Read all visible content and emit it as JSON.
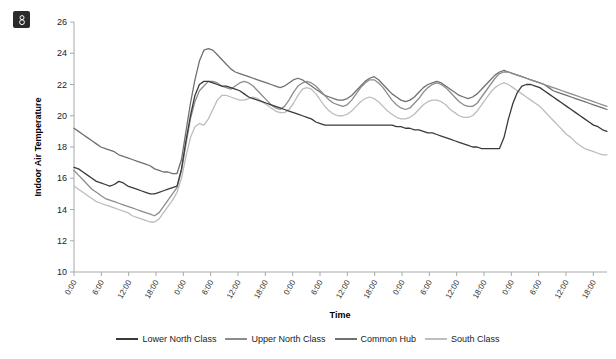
{
  "corner_icon": "image-placeholder-icon",
  "chart_data": {
    "type": "line",
    "title": "",
    "xlabel": "Time",
    "ylabel": "Indoor Air Temperature",
    "ylim": [
      10,
      26
    ],
    "ytick_labels": [
      "10",
      "12",
      "14",
      "16",
      "18",
      "20",
      "22",
      "24",
      "26"
    ],
    "ytick_values": [
      10,
      12,
      14,
      16,
      18,
      20,
      22,
      24,
      26
    ],
    "grid": false,
    "legend_position": "bottom",
    "xtick_labels": [
      "0:00",
      "6:00",
      "12:00",
      "18:00",
      "0:00",
      "6:00",
      "12:00",
      "18:00",
      "0:00",
      "6:00",
      "12:00",
      "18:00",
      "0:00",
      "6:00",
      "12:00",
      "18:00",
      "0:00",
      "6:00",
      "12:00",
      "18:00"
    ],
    "x_hours": [
      0,
      6,
      12,
      18,
      24,
      30,
      36,
      42,
      48,
      54,
      60,
      66,
      72,
      78,
      84,
      90,
      96,
      102,
      108,
      114
    ],
    "xlim_hours": [
      0,
      117
    ],
    "series": [
      {
        "name": "Lower North Class",
        "color": "#3a3a3a",
        "values": [
          16.7,
          16.6,
          16.4,
          16.2,
          16.0,
          15.8,
          15.7,
          15.6,
          15.5,
          15.6,
          15.8,
          15.7,
          15.5,
          15.4,
          15.3,
          15.2,
          15.1,
          15.0,
          15.0,
          15.1,
          15.2,
          15.3,
          15.4,
          15.5,
          16.6,
          18.4,
          20.0,
          21.3,
          22.0,
          22.2,
          22.2,
          22.1,
          22.0,
          21.9,
          21.9,
          21.8,
          21.7,
          21.6,
          21.4,
          21.2,
          21.1,
          21.0,
          20.9,
          20.8,
          20.7,
          20.6,
          20.5,
          20.4,
          20.3,
          20.2,
          20.1,
          20.0,
          19.9,
          19.8,
          19.6,
          19.5,
          19.4,
          19.4,
          19.4,
          19.4,
          19.4,
          19.4,
          19.4,
          19.4,
          19.4,
          19.4,
          19.4,
          19.4,
          19.4,
          19.4,
          19.4,
          19.4,
          19.3,
          19.3,
          19.2,
          19.2,
          19.1,
          19.1,
          19.0,
          18.9,
          18.9,
          18.8,
          18.7,
          18.6,
          18.5,
          18.4,
          18.3,
          18.2,
          18.1,
          18.0,
          18.0,
          17.9,
          17.9,
          17.9,
          17.9,
          17.9,
          18.6,
          19.8,
          20.8,
          21.5,
          21.9,
          22.0,
          22.0,
          21.9,
          21.8,
          21.6,
          21.4,
          21.2,
          21.0,
          20.8,
          20.6,
          20.4,
          20.2,
          20.0,
          19.8,
          19.6,
          19.4,
          19.3,
          19.1,
          19.0
        ]
      },
      {
        "name": "Upper North Class",
        "color": "#8c8c8c",
        "values": [
          16.5,
          16.2,
          15.9,
          15.6,
          15.3,
          15.1,
          14.9,
          14.7,
          14.6,
          14.5,
          14.4,
          14.3,
          14.2,
          14.1,
          14.0,
          13.9,
          13.8,
          13.7,
          13.6,
          13.8,
          14.2,
          14.6,
          15.0,
          15.4,
          16.5,
          18.2,
          19.8,
          20.9,
          21.6,
          21.9,
          22.2,
          22.2,
          22.1,
          21.9,
          21.8,
          21.7,
          21.9,
          22.1,
          22.2,
          22.1,
          21.9,
          21.6,
          21.3,
          21.0,
          20.7,
          20.5,
          20.4,
          20.6,
          21.0,
          21.5,
          21.9,
          22.1,
          22.2,
          22.1,
          21.9,
          21.6,
          21.3,
          21.0,
          20.8,
          20.7,
          20.6,
          20.7,
          21.0,
          21.4,
          21.8,
          22.1,
          22.3,
          22.3,
          22.1,
          21.8,
          21.4,
          21.0,
          20.7,
          20.5,
          20.4,
          20.5,
          20.8,
          21.1,
          21.5,
          21.8,
          22.0,
          22.1,
          22.0,
          21.8,
          21.5,
          21.2,
          20.9,
          20.7,
          20.6,
          20.6,
          20.8,
          21.2,
          21.6,
          22.0,
          22.4,
          22.7,
          22.8,
          22.8,
          22.7,
          22.6,
          22.5,
          22.4,
          22.3,
          22.2,
          22.1,
          22.0,
          21.9,
          21.8,
          21.7,
          21.6,
          21.5,
          21.4,
          21.3,
          21.2,
          21.1,
          21.0,
          20.9,
          20.8,
          20.7,
          20.6
        ]
      },
      {
        "name": "Common Hub",
        "color": "#707070",
        "values": [
          19.2,
          19.0,
          18.8,
          18.6,
          18.4,
          18.2,
          18.0,
          17.9,
          17.8,
          17.7,
          17.5,
          17.4,
          17.3,
          17.2,
          17.1,
          17.0,
          16.9,
          16.8,
          16.6,
          16.5,
          16.4,
          16.4,
          16.3,
          16.3,
          17.2,
          19.0,
          20.8,
          22.3,
          23.5,
          24.2,
          24.3,
          24.2,
          23.9,
          23.6,
          23.3,
          23.0,
          22.8,
          22.7,
          22.6,
          22.5,
          22.4,
          22.3,
          22.2,
          22.1,
          22.0,
          21.9,
          21.8,
          21.9,
          22.1,
          22.3,
          22.4,
          22.3,
          22.1,
          21.9,
          21.7,
          21.5,
          21.3,
          21.2,
          21.1,
          21.0,
          21.0,
          21.1,
          21.3,
          21.6,
          21.9,
          22.2,
          22.4,
          22.5,
          22.3,
          22.0,
          21.7,
          21.4,
          21.2,
          21.0,
          20.9,
          21.0,
          21.2,
          21.5,
          21.8,
          22.0,
          22.1,
          22.2,
          22.1,
          21.9,
          21.7,
          21.5,
          21.3,
          21.2,
          21.1,
          21.2,
          21.4,
          21.7,
          22.0,
          22.3,
          22.6,
          22.8,
          22.9,
          22.8,
          22.7,
          22.6,
          22.5,
          22.4,
          22.3,
          22.2,
          22.1,
          22.0,
          21.8,
          21.6,
          21.5,
          21.4,
          21.3,
          21.2,
          21.1,
          21.0,
          20.9,
          20.8,
          20.7,
          20.6,
          20.5,
          20.4
        ]
      },
      {
        "name": "South Class",
        "color": "#bdbdbd",
        "values": [
          15.5,
          15.3,
          15.1,
          14.9,
          14.7,
          14.5,
          14.4,
          14.3,
          14.2,
          14.1,
          14.0,
          13.9,
          13.8,
          13.6,
          13.5,
          13.4,
          13.3,
          13.2,
          13.2,
          13.4,
          13.8,
          14.2,
          14.6,
          15.1,
          16.0,
          17.4,
          18.6,
          19.3,
          19.5,
          19.4,
          19.8,
          20.4,
          21.0,
          21.3,
          21.3,
          21.2,
          21.1,
          21.0,
          21.0,
          21.1,
          21.2,
          21.1,
          20.9,
          20.7,
          20.5,
          20.3,
          20.2,
          20.2,
          20.4,
          20.8,
          21.3,
          21.7,
          21.8,
          21.7,
          21.4,
          21.0,
          20.6,
          20.3,
          20.1,
          20.0,
          20.0,
          20.1,
          20.3,
          20.6,
          20.9,
          21.1,
          21.2,
          21.1,
          20.9,
          20.6,
          20.3,
          20.1,
          19.9,
          19.8,
          19.8,
          19.9,
          20.1,
          20.4,
          20.7,
          20.9,
          21.0,
          21.0,
          20.9,
          20.7,
          20.4,
          20.2,
          20.0,
          19.9,
          19.9,
          20.0,
          20.3,
          20.7,
          21.1,
          21.5,
          21.8,
          22.0,
          22.1,
          22.0,
          21.8,
          21.6,
          21.4,
          21.2,
          21.0,
          20.8,
          20.6,
          20.3,
          20.0,
          19.7,
          19.4,
          19.1,
          18.8,
          18.6,
          18.3,
          18.1,
          17.9,
          17.8,
          17.7,
          17.6,
          17.5,
          17.5
        ]
      }
    ]
  },
  "legend": {
    "items": [
      {
        "label": "Lower North Class",
        "color": "#3a3a3a"
      },
      {
        "label": "Upper North Class",
        "color": "#8c8c8c"
      },
      {
        "label": "Common Hub",
        "color": "#707070"
      },
      {
        "label": "South Class",
        "color": "#bdbdbd"
      }
    ]
  }
}
